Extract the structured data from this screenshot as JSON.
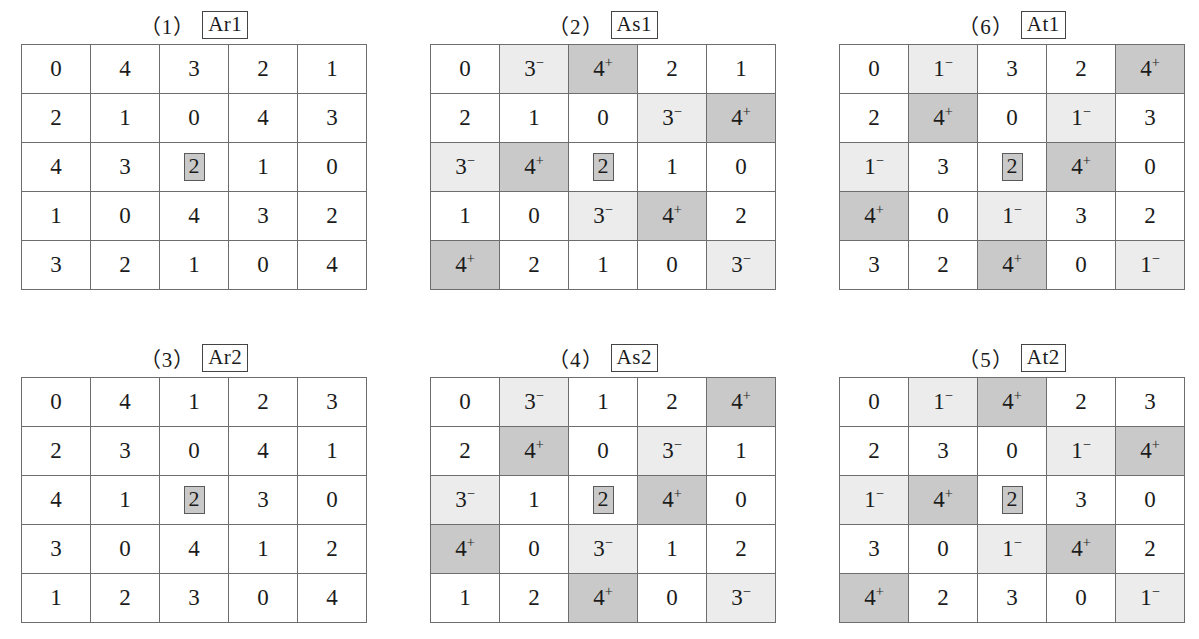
{
  "page": {
    "colors": {
      "light_shade": "#ececec",
      "dark_shade": "#c9c9c9",
      "grid_line": "#6d6d6d",
      "text": "#1b1b1b",
      "background": "#ffffff"
    }
  },
  "panels": [
    {
      "index_label": "（1）",
      "name": "Ar1",
      "position": {
        "left": 21,
        "top": 8,
        "cell_w": 68,
        "cell_h": 48
      },
      "rows": [
        [
          {
            "value": "0",
            "shade": "none",
            "marked": false
          },
          {
            "value": "4",
            "shade": "none",
            "marked": false
          },
          {
            "value": "3",
            "shade": "none",
            "marked": false
          },
          {
            "value": "2",
            "shade": "none",
            "marked": false
          },
          {
            "value": "1",
            "shade": "none",
            "marked": false
          }
        ],
        [
          {
            "value": "2",
            "shade": "none",
            "marked": false
          },
          {
            "value": "1",
            "shade": "none",
            "marked": false
          },
          {
            "value": "0",
            "shade": "none",
            "marked": false
          },
          {
            "value": "4",
            "shade": "none",
            "marked": false
          },
          {
            "value": "3",
            "shade": "none",
            "marked": false
          }
        ],
        [
          {
            "value": "4",
            "shade": "none",
            "marked": false
          },
          {
            "value": "3",
            "shade": "none",
            "marked": false
          },
          {
            "value": "2",
            "shade": "none",
            "marked": true
          },
          {
            "value": "1",
            "shade": "none",
            "marked": false
          },
          {
            "value": "0",
            "shade": "none",
            "marked": false
          }
        ],
        [
          {
            "value": "1",
            "shade": "none",
            "marked": false
          },
          {
            "value": "0",
            "shade": "none",
            "marked": false
          },
          {
            "value": "4",
            "shade": "none",
            "marked": false
          },
          {
            "value": "3",
            "shade": "none",
            "marked": false
          },
          {
            "value": "2",
            "shade": "none",
            "marked": false
          }
        ],
        [
          {
            "value": "3",
            "shade": "none",
            "marked": false
          },
          {
            "value": "2",
            "shade": "none",
            "marked": false
          },
          {
            "value": "1",
            "shade": "none",
            "marked": false
          },
          {
            "value": "0",
            "shade": "none",
            "marked": false
          },
          {
            "value": "4",
            "shade": "none",
            "marked": false
          }
        ]
      ]
    },
    {
      "index_label": "（2）",
      "name": "As1",
      "position": {
        "left": 430,
        "top": 8,
        "cell_w": 68,
        "cell_h": 48
      },
      "rows": [
        [
          {
            "value": "0",
            "shade": "none",
            "marked": false
          },
          {
            "value": "3",
            "sup": "−",
            "shade": "light",
            "marked": false
          },
          {
            "value": "4",
            "sup": "+",
            "shade": "dark",
            "marked": false
          },
          {
            "value": "2",
            "shade": "none",
            "marked": false
          },
          {
            "value": "1",
            "shade": "none",
            "marked": false
          }
        ],
        [
          {
            "value": "2",
            "shade": "none",
            "marked": false
          },
          {
            "value": "1",
            "shade": "none",
            "marked": false
          },
          {
            "value": "0",
            "shade": "none",
            "marked": false
          },
          {
            "value": "3",
            "sup": "−",
            "shade": "light",
            "marked": false
          },
          {
            "value": "4",
            "sup": "+",
            "shade": "dark",
            "marked": false
          }
        ],
        [
          {
            "value": "3",
            "sup": "−",
            "shade": "light",
            "marked": false
          },
          {
            "value": "4",
            "sup": "+",
            "shade": "dark",
            "marked": false
          },
          {
            "value": "2",
            "shade": "none",
            "marked": true
          },
          {
            "value": "1",
            "shade": "none",
            "marked": false
          },
          {
            "value": "0",
            "shade": "none",
            "marked": false
          }
        ],
        [
          {
            "value": "1",
            "shade": "none",
            "marked": false
          },
          {
            "value": "0",
            "shade": "none",
            "marked": false
          },
          {
            "value": "3",
            "sup": "−",
            "shade": "light",
            "marked": false
          },
          {
            "value": "4",
            "sup": "+",
            "shade": "dark",
            "marked": false
          },
          {
            "value": "2",
            "shade": "none",
            "marked": false
          }
        ],
        [
          {
            "value": "4",
            "sup": "+",
            "shade": "dark",
            "marked": false
          },
          {
            "value": "2",
            "shade": "none",
            "marked": false
          },
          {
            "value": "1",
            "shade": "none",
            "marked": false
          },
          {
            "value": "0",
            "shade": "none",
            "marked": false
          },
          {
            "value": "3",
            "sup": "−",
            "shade": "light",
            "marked": false
          }
        ]
      ]
    },
    {
      "index_label": "（6）",
      "name": "At1",
      "position": {
        "left": 839,
        "top": 8,
        "cell_w": 68,
        "cell_h": 48
      },
      "rows": [
        [
          {
            "value": "0",
            "shade": "none",
            "marked": false
          },
          {
            "value": "1",
            "sup": "−",
            "shade": "light",
            "marked": false
          },
          {
            "value": "3",
            "shade": "none",
            "marked": false
          },
          {
            "value": "2",
            "shade": "none",
            "marked": false
          },
          {
            "value": "4",
            "sup": "+",
            "shade": "dark",
            "marked": false
          }
        ],
        [
          {
            "value": "2",
            "shade": "none",
            "marked": false
          },
          {
            "value": "4",
            "sup": "+",
            "shade": "dark",
            "marked": false
          },
          {
            "value": "0",
            "shade": "none",
            "marked": false
          },
          {
            "value": "1",
            "sup": "−",
            "shade": "light",
            "marked": false
          },
          {
            "value": "3",
            "shade": "none",
            "marked": false
          }
        ],
        [
          {
            "value": "1",
            "sup": "−",
            "shade": "light",
            "marked": false
          },
          {
            "value": "3",
            "shade": "none",
            "marked": false
          },
          {
            "value": "2",
            "shade": "none",
            "marked": true
          },
          {
            "value": "4",
            "sup": "+",
            "shade": "dark",
            "marked": false
          },
          {
            "value": "0",
            "shade": "none",
            "marked": false
          }
        ],
        [
          {
            "value": "4",
            "sup": "+",
            "shade": "dark",
            "marked": false
          },
          {
            "value": "0",
            "shade": "none",
            "marked": false
          },
          {
            "value": "1",
            "sup": "−",
            "shade": "light",
            "marked": false
          },
          {
            "value": "3",
            "shade": "none",
            "marked": false
          },
          {
            "value": "2",
            "shade": "none",
            "marked": false
          }
        ],
        [
          {
            "value": "3",
            "shade": "none",
            "marked": false
          },
          {
            "value": "2",
            "shade": "none",
            "marked": false
          },
          {
            "value": "4",
            "sup": "+",
            "shade": "dark",
            "marked": false
          },
          {
            "value": "0",
            "shade": "none",
            "marked": false
          },
          {
            "value": "1",
            "sup": "−",
            "shade": "light",
            "marked": false
          }
        ]
      ]
    },
    {
      "index_label": "（3）",
      "name": "Ar2",
      "position": {
        "left": 21,
        "top": 341,
        "cell_w": 68,
        "cell_h": 48
      },
      "rows": [
        [
          {
            "value": "0",
            "shade": "none",
            "marked": false
          },
          {
            "value": "4",
            "shade": "none",
            "marked": false
          },
          {
            "value": "1",
            "shade": "none",
            "marked": false
          },
          {
            "value": "2",
            "shade": "none",
            "marked": false
          },
          {
            "value": "3",
            "shade": "none",
            "marked": false
          }
        ],
        [
          {
            "value": "2",
            "shade": "none",
            "marked": false
          },
          {
            "value": "3",
            "shade": "none",
            "marked": false
          },
          {
            "value": "0",
            "shade": "none",
            "marked": false
          },
          {
            "value": "4",
            "shade": "none",
            "marked": false
          },
          {
            "value": "1",
            "shade": "none",
            "marked": false
          }
        ],
        [
          {
            "value": "4",
            "shade": "none",
            "marked": false
          },
          {
            "value": "1",
            "shade": "none",
            "marked": false
          },
          {
            "value": "2",
            "shade": "none",
            "marked": true
          },
          {
            "value": "3",
            "shade": "none",
            "marked": false
          },
          {
            "value": "0",
            "shade": "none",
            "marked": false
          }
        ],
        [
          {
            "value": "3",
            "shade": "none",
            "marked": false
          },
          {
            "value": "0",
            "shade": "none",
            "marked": false
          },
          {
            "value": "4",
            "shade": "none",
            "marked": false
          },
          {
            "value": "1",
            "shade": "none",
            "marked": false
          },
          {
            "value": "2",
            "shade": "none",
            "marked": false
          }
        ],
        [
          {
            "value": "1",
            "shade": "none",
            "marked": false
          },
          {
            "value": "2",
            "shade": "none",
            "marked": false
          },
          {
            "value": "3",
            "shade": "none",
            "marked": false
          },
          {
            "value": "0",
            "shade": "none",
            "marked": false
          },
          {
            "value": "4",
            "shade": "none",
            "marked": false
          }
        ]
      ]
    },
    {
      "index_label": "（4）",
      "name": "As2",
      "position": {
        "left": 430,
        "top": 341,
        "cell_w": 68,
        "cell_h": 48
      },
      "rows": [
        [
          {
            "value": "0",
            "shade": "none",
            "marked": false
          },
          {
            "value": "3",
            "sup": "−",
            "shade": "light",
            "marked": false
          },
          {
            "value": "1",
            "shade": "none",
            "marked": false
          },
          {
            "value": "2",
            "shade": "none",
            "marked": false
          },
          {
            "value": "4",
            "sup": "+",
            "shade": "dark",
            "marked": false
          }
        ],
        [
          {
            "value": "2",
            "shade": "none",
            "marked": false
          },
          {
            "value": "4",
            "sup": "+",
            "shade": "dark",
            "marked": false
          },
          {
            "value": "0",
            "shade": "none",
            "marked": false
          },
          {
            "value": "3",
            "sup": "−",
            "shade": "light",
            "marked": false
          },
          {
            "value": "1",
            "shade": "none",
            "marked": false
          }
        ],
        [
          {
            "value": "3",
            "sup": "−",
            "shade": "light",
            "marked": false
          },
          {
            "value": "1",
            "shade": "none",
            "marked": false
          },
          {
            "value": "2",
            "shade": "none",
            "marked": true
          },
          {
            "value": "4",
            "sup": "+",
            "shade": "dark",
            "marked": false
          },
          {
            "value": "0",
            "shade": "none",
            "marked": false
          }
        ],
        [
          {
            "value": "4",
            "sup": "+",
            "shade": "dark",
            "marked": false
          },
          {
            "value": "0",
            "shade": "none",
            "marked": false
          },
          {
            "value": "3",
            "sup": "−",
            "shade": "light",
            "marked": false
          },
          {
            "value": "1",
            "shade": "none",
            "marked": false
          },
          {
            "value": "2",
            "shade": "none",
            "marked": false
          }
        ],
        [
          {
            "value": "1",
            "shade": "none",
            "marked": false
          },
          {
            "value": "2",
            "shade": "none",
            "marked": false
          },
          {
            "value": "4",
            "sup": "+",
            "shade": "dark",
            "marked": false
          },
          {
            "value": "0",
            "shade": "none",
            "marked": false
          },
          {
            "value": "3",
            "sup": "−",
            "shade": "light",
            "marked": false
          }
        ]
      ]
    },
    {
      "index_label": "（5）",
      "name": "At2",
      "position": {
        "left": 839,
        "top": 341,
        "cell_w": 68,
        "cell_h": 48
      },
      "rows": [
        [
          {
            "value": "0",
            "shade": "none",
            "marked": false
          },
          {
            "value": "1",
            "sup": "−",
            "shade": "light",
            "marked": false
          },
          {
            "value": "4",
            "sup": "+",
            "shade": "dark",
            "marked": false
          },
          {
            "value": "2",
            "shade": "none",
            "marked": false
          },
          {
            "value": "3",
            "shade": "none",
            "marked": false
          }
        ],
        [
          {
            "value": "2",
            "shade": "none",
            "marked": false
          },
          {
            "value": "3",
            "shade": "none",
            "marked": false
          },
          {
            "value": "0",
            "shade": "none",
            "marked": false
          },
          {
            "value": "1",
            "sup": "−",
            "shade": "light",
            "marked": false
          },
          {
            "value": "4",
            "sup": "+",
            "shade": "dark",
            "marked": false
          }
        ],
        [
          {
            "value": "1",
            "sup": "−",
            "shade": "light",
            "marked": false
          },
          {
            "value": "4",
            "sup": "+",
            "shade": "dark",
            "marked": false
          },
          {
            "value": "2",
            "shade": "none",
            "marked": true
          },
          {
            "value": "3",
            "shade": "none",
            "marked": false
          },
          {
            "value": "0",
            "shade": "none",
            "marked": false
          }
        ],
        [
          {
            "value": "3",
            "shade": "none",
            "marked": false
          },
          {
            "value": "0",
            "shade": "none",
            "marked": false
          },
          {
            "value": "1",
            "sup": "−",
            "shade": "light",
            "marked": false
          },
          {
            "value": "4",
            "sup": "+",
            "shade": "dark",
            "marked": false
          },
          {
            "value": "2",
            "shade": "none",
            "marked": false
          }
        ],
        [
          {
            "value": "4",
            "sup": "+",
            "shade": "dark",
            "marked": false
          },
          {
            "value": "2",
            "shade": "none",
            "marked": false
          },
          {
            "value": "3",
            "shade": "none",
            "marked": false
          },
          {
            "value": "0",
            "shade": "none",
            "marked": false
          },
          {
            "value": "1",
            "sup": "−",
            "shade": "light",
            "marked": false
          }
        ]
      ]
    }
  ]
}
